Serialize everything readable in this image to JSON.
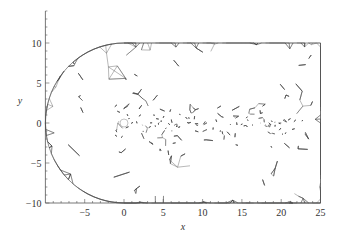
{
  "figure": {
    "type": "unstructured triangular mesh",
    "xlabel": "x",
    "ylabel": "y",
    "x_ticks": [
      "-5",
      "0",
      "5",
      "10",
      "15",
      "20",
      "25"
    ],
    "x_tick_values": [
      -5,
      0,
      5,
      10,
      15,
      20,
      25
    ],
    "y_ticks": [
      "10",
      "5",
      "0",
      "-5",
      "-10"
    ],
    "y_tick_values": [
      10,
      5,
      0,
      -5,
      -10
    ],
    "xlim": [
      -10,
      25
    ],
    "ylim": [
      -10,
      14
    ],
    "domain": {
      "inlet": "semicircle of radius 10 centered at origin",
      "outlet_x": 25,
      "top_y": 10,
      "bottom_y": -10
    },
    "cylinder": {
      "center": [
        0,
        0
      ],
      "radius": 0.5,
      "fill": "#ffffff"
    },
    "wake_refinement": {
      "x_from": 0,
      "x_to": 20,
      "y_from": -2,
      "y_to": 2
    },
    "colors": {
      "mesh_line": "#333333",
      "axis": "#555555",
      "background": "#ffffff"
    }
  }
}
